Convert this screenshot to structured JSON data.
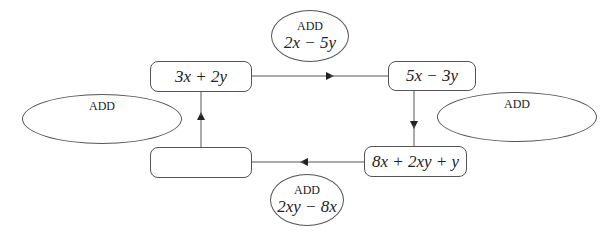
{
  "diagram": {
    "type": "flow-cycle",
    "boxes": [
      {
        "id": "top-left",
        "text": "3x + 2y"
      },
      {
        "id": "top-right",
        "text": "5x − 3y"
      },
      {
        "id": "bottom-right",
        "text": "8x + 2xy + y"
      },
      {
        "id": "bottom-left",
        "text": ""
      }
    ],
    "operations": [
      {
        "id": "op-top",
        "label": "ADD",
        "expr": "2x − 5y"
      },
      {
        "id": "op-right",
        "label": "ADD",
        "expr": ""
      },
      {
        "id": "op-bottom",
        "label": "ADD",
        "expr": "2xy − 8x"
      },
      {
        "id": "op-left",
        "label": "ADD",
        "expr": ""
      }
    ]
  }
}
